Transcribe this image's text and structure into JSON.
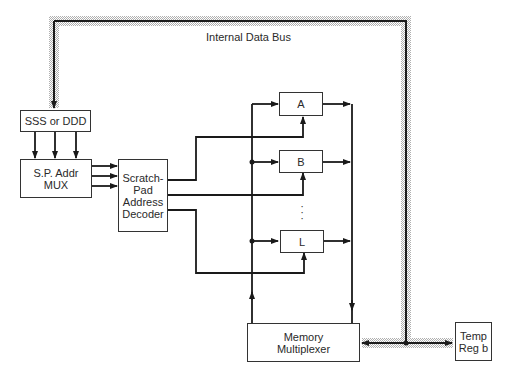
{
  "diagram": {
    "bus_label": "Internal Data Bus",
    "blocks": {
      "sss_ddd": "SSS or DDD",
      "sp_addr_mux": "S.P. Addr\nMUX",
      "decoder": "Scratch-\nPad\nAddress\nDecoder",
      "reg_a": "A",
      "reg_b": "B",
      "reg_l": "L",
      "ellipsis": "·\n·\n·",
      "memory_mux": "Memory\nMultiplexer",
      "temp_reg": "Temp\nReg b"
    },
    "colors": {
      "line": "#1a1a1a",
      "bus_shade": "#c8c8c8",
      "box_border": "#333333"
    }
  }
}
